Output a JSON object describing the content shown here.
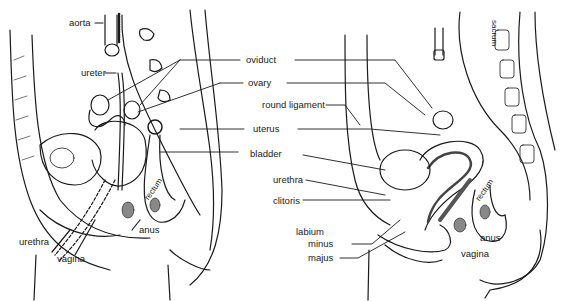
{
  "figure": {
    "left_panel": {
      "labels": [
        {
          "id": "aorta",
          "text": "aorta"
        },
        {
          "id": "ureter",
          "text": "ureter"
        },
        {
          "id": "rectum",
          "text": "rectum"
        },
        {
          "id": "anus",
          "text": "anus"
        },
        {
          "id": "urethra",
          "text": "urethra"
        },
        {
          "id": "vagina",
          "text": "vagina"
        }
      ]
    },
    "center_labels": [
      {
        "id": "oviduct",
        "text": "oviduct"
      },
      {
        "id": "ovary",
        "text": "ovary"
      },
      {
        "id": "round_ligament",
        "text": "round ligament"
      },
      {
        "id": "uterus",
        "text": "uterus"
      },
      {
        "id": "bladder",
        "text": "bladder"
      },
      {
        "id": "urethra",
        "text": "urethra"
      },
      {
        "id": "clitoris",
        "text": "clitoris"
      },
      {
        "id": "labium",
        "text": "labium"
      },
      {
        "id": "minus",
        "text": "minus"
      },
      {
        "id": "majus",
        "text": "majus"
      }
    ],
    "right_panel": {
      "labels": [
        {
          "id": "sacrum",
          "text": "sacrum"
        },
        {
          "id": "rectum",
          "text": "rectum"
        },
        {
          "id": "anus",
          "text": "anus"
        },
        {
          "id": "vagina",
          "text": "vagina"
        }
      ]
    },
    "colors": {
      "ink": "#1a1a1a",
      "background": "#ffffff",
      "shade": "#555555"
    }
  }
}
